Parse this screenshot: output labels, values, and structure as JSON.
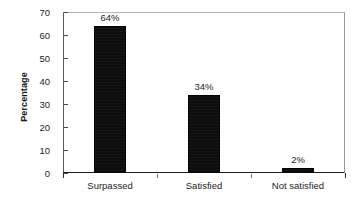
{
  "chart_data": {
    "type": "bar",
    "title": "",
    "xlabel": "",
    "ylabel": "Percentage",
    "categories": [
      "Surpassed",
      "Satisfied",
      "Not satisfied"
    ],
    "values": [
      64,
      34,
      2
    ],
    "data_labels": [
      "64%",
      "34%",
      "2%"
    ],
    "ylim": [
      0,
      70
    ],
    "yticks": [
      0,
      10,
      20,
      30,
      40,
      50,
      60,
      70
    ],
    "ytick_labels": [
      "0",
      "10",
      "20",
      "30",
      "40",
      "50",
      "60",
      "70"
    ],
    "grid": false,
    "legend": false,
    "bar_color": "#0d0d0d",
    "series": [
      {
        "name": "Percentage",
        "values": [
          64,
          34,
          2
        ]
      }
    ]
  }
}
